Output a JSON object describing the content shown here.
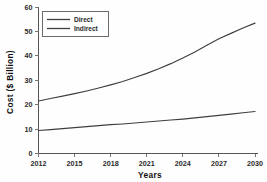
{
  "chart_data": {
    "type": "line",
    "title": "",
    "xlabel": "Years",
    "ylabel": "Cost ($ Billion)",
    "xlim": [
      2012,
      2030
    ],
    "ylim": [
      0,
      60
    ],
    "xticks": [
      2012,
      2015,
      2018,
      2021,
      2024,
      2027,
      2030
    ],
    "xtick_labels": [
      "2012",
      "2015",
      "2018",
      "2021",
      "2024",
      "2027",
      "2030"
    ],
    "yticks": [
      0,
      10,
      20,
      30,
      40,
      50,
      60
    ],
    "ytick_labels": [
      "0",
      "10",
      "20",
      "30",
      "40",
      "50",
      "60"
    ],
    "grid": false,
    "legend_position": "upper left",
    "x": [
      2012,
      2013,
      2014,
      2015,
      2016,
      2017,
      2018,
      2019,
      2020,
      2021,
      2022,
      2023,
      2024,
      2025,
      2026,
      2027,
      2028,
      2029,
      2030
    ],
    "series": [
      {
        "name": "Direct",
        "color": "#3f3f3f",
        "values": [
          21.5,
          22.5,
          23.5,
          24.5,
          25.6,
          26.8,
          28.1,
          29.5,
          31.1,
          32.8,
          34.7,
          36.8,
          39.1,
          41.6,
          44.3,
          47.0,
          49.2,
          51.4,
          53.4
        ]
      },
      {
        "name": "Indirect",
        "color": "#3f3f3f",
        "values": [
          9.4,
          9.8,
          10.2,
          10.6,
          11.0,
          11.4,
          11.8,
          12.1,
          12.5,
          12.9,
          13.3,
          13.7,
          14.1,
          14.6,
          15.1,
          15.6,
          16.1,
          16.7,
          17.2
        ]
      }
    ]
  },
  "legend": {
    "entries": [
      {
        "label": "Direct"
      },
      {
        "label": "Indirect"
      }
    ]
  },
  "axes": {
    "y_title": "Cost ($ Billion)",
    "x_title": "Years"
  }
}
